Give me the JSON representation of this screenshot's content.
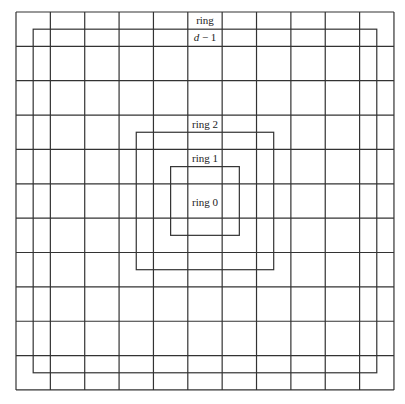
{
  "diagram": {
    "type": "grid-rings",
    "grid": {
      "rows": 11,
      "cols": 11,
      "origin_x": 16,
      "origin_y": 12,
      "cell_size": 34.36,
      "line_color": "#333333"
    },
    "rings": [
      {
        "name": "ring 0",
        "label": "ring 0",
        "inset_cells": 5,
        "draw_box": false
      },
      {
        "name": "ring 1",
        "label": "ring 1",
        "inset_cells": 4.5,
        "draw_box": true
      },
      {
        "name": "ring 2",
        "label": "ring 2",
        "inset_cells": 3.5,
        "draw_box": true
      },
      {
        "name": "ring d-1",
        "label_line1": "ring",
        "label_line2_var": "d",
        "label_line2_rest": " − 1",
        "inset_cells": 0.5,
        "draw_box": true
      }
    ]
  },
  "labels": {
    "ring0": "ring 0",
    "ring1": "ring 1",
    "ring2": "ring 2",
    "ringd_line1": "ring",
    "ringd_var": "d",
    "ringd_rest": " − 1"
  }
}
